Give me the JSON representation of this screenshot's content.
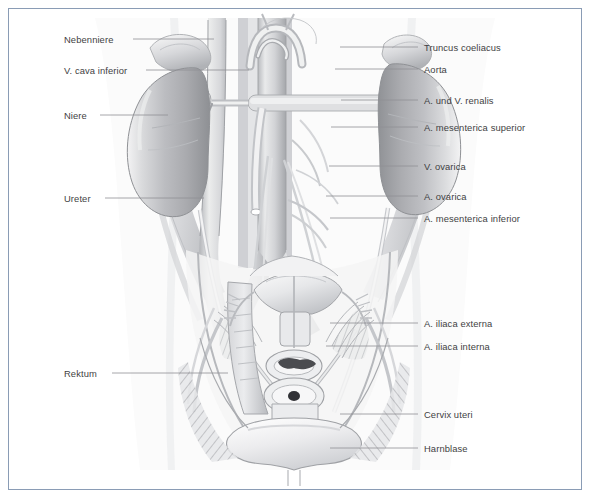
{
  "figure": {
    "style": "grayscale anatomical airbrush illustration",
    "border_color": "#8a9cb5",
    "background_color": "#ffffff",
    "label_text_color": "#3f3f43",
    "leader_line_color": "#8f8f96"
  },
  "labels_left": [
    {
      "text": "Nebenniere",
      "x": 64,
      "y": 34,
      "line_x1": 133,
      "line_y1": 39,
      "line_x2": 214,
      "line_y2": 39
    },
    {
      "text": "V. cava inferior",
      "x": 64,
      "y": 65,
      "line_x1": 146,
      "line_y1": 70,
      "line_x2": 249,
      "line_y2": 70
    },
    {
      "text": "Niere",
      "x": 64,
      "y": 110,
      "line_x1": 100,
      "line_y1": 115,
      "line_x2": 168,
      "line_y2": 115
    },
    {
      "text": "Ureter",
      "x": 64,
      "y": 193,
      "line_x1": 105,
      "line_y1": 198,
      "line_x2": 204,
      "line_y2": 198
    },
    {
      "text": "Rektum",
      "x": 64,
      "y": 368,
      "line_x1": 112,
      "line_y1": 373,
      "line_x2": 228,
      "line_y2": 373
    }
  ],
  "labels_right": [
    {
      "text": "Truncus coeliacus",
      "x": 424,
      "y": 42,
      "line_x1": 340,
      "line_y1": 47,
      "line_x2": 418,
      "line_y2": 47
    },
    {
      "text": "Aorta",
      "x": 424,
      "y": 64,
      "line_x1": 335,
      "line_y1": 69,
      "line_x2": 418,
      "line_y2": 69
    },
    {
      "text": "A. und V. renalis",
      "x": 424,
      "y": 95,
      "line_x1": 341,
      "line_y1": 100,
      "line_x2": 418,
      "line_y2": 100
    },
    {
      "text": "A. mesenterica superior",
      "x": 424,
      "y": 122,
      "line_x1": 331,
      "line_y1": 127,
      "line_x2": 418,
      "line_y2": 127
    },
    {
      "text": "V. ovarica",
      "x": 424,
      "y": 161,
      "line_x1": 329,
      "line_y1": 166,
      "line_x2": 418,
      "line_y2": 166
    },
    {
      "text": "A. ovarica",
      "x": 424,
      "y": 191,
      "line_x1": 326,
      "line_y1": 196,
      "line_x2": 418,
      "line_y2": 196
    },
    {
      "text": "A. mesenterica inferior",
      "x": 424,
      "y": 213,
      "line_x1": 330,
      "line_y1": 218,
      "line_x2": 418,
      "line_y2": 218
    },
    {
      "text": "A. iliaca externa",
      "x": 424,
      "y": 318,
      "line_x1": 330,
      "line_y1": 323,
      "line_x2": 418,
      "line_y2": 323
    },
    {
      "text": "A. iliaca interna",
      "x": 424,
      "y": 341,
      "line_x1": 326,
      "line_y1": 346,
      "line_x2": 418,
      "line_y2": 346
    },
    {
      "text": "Cervix uteri",
      "x": 424,
      "y": 409,
      "line_x1": 340,
      "line_y1": 414,
      "line_x2": 418,
      "line_y2": 414
    },
    {
      "text": "Harnblase",
      "x": 424,
      "y": 443,
      "line_x1": 330,
      "line_y1": 448,
      "line_x2": 418,
      "line_y2": 448
    }
  ]
}
